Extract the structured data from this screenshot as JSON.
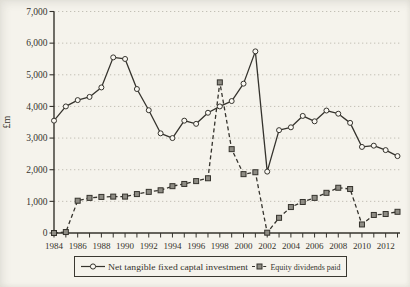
{
  "figure": {
    "y_axis_title": "£m",
    "colors": {
      "background": "#f5f3ec",
      "ink": "#35332d",
      "grid": "#bdbab0",
      "circle_fill": "#faf8f2",
      "square_fill": "#8e8c84"
    }
  },
  "chart_data": {
    "type": "line",
    "title": "",
    "xlabel": "",
    "ylabel": "£m",
    "ylim": [
      0,
      7000
    ],
    "y_ticks": [
      0,
      1000,
      2000,
      3000,
      4000,
      5000,
      6000,
      7000
    ],
    "y_tick_labels": [
      "0",
      "1,000",
      "2,000",
      "3,000",
      "4,000",
      "5,000",
      "6,000",
      "7,000"
    ],
    "x": [
      1984,
      1985,
      1986,
      1987,
      1988,
      1989,
      1990,
      1991,
      1992,
      1993,
      1994,
      1995,
      1996,
      1997,
      1998,
      1999,
      2000,
      2001,
      2002,
      2003,
      2004,
      2005,
      2006,
      2007,
      2008,
      2009,
      2010,
      2011,
      2012,
      2013
    ],
    "x_label_every": 2,
    "x_tick_labels": [
      "1984",
      "1986",
      "1988",
      "1990",
      "1992",
      "1994",
      "1996",
      "1998",
      "2000",
      "2002",
      "2004",
      "2006",
      "2008",
      "2010",
      "2012"
    ],
    "grid": "horizontal-dotted",
    "legend_position": "bottom",
    "series": [
      {
        "name": "Net tangible fixed captal investment",
        "style": "solid",
        "marker": "circle",
        "values": [
          3550,
          4000,
          4200,
          4300,
          4600,
          5550,
          5500,
          4550,
          3880,
          3150,
          3000,
          3550,
          3450,
          3800,
          4000,
          4170,
          4720,
          5740,
          1940,
          3250,
          3340,
          3700,
          3530,
          3870,
          3770,
          3480,
          2720,
          2760,
          2620,
          2430
        ]
      },
      {
        "name": "Equity dividends paid",
        "style": "dashed",
        "marker": "square",
        "values": [
          0,
          30,
          1020,
          1110,
          1140,
          1150,
          1150,
          1230,
          1300,
          1350,
          1480,
          1550,
          1640,
          1730,
          4760,
          2650,
          1860,
          1920,
          10,
          480,
          820,
          980,
          1110,
          1270,
          1430,
          1390,
          270,
          570,
          600,
          670
        ]
      }
    ]
  }
}
